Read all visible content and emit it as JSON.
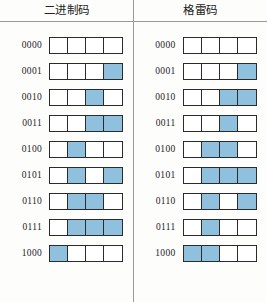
{
  "figure": {
    "title": "",
    "colors": {
      "bit_on": "#8fc1de",
      "bit_off": "#ffffff",
      "cell_border": "#2b2b2b",
      "rule": "#9a9a9a",
      "background": "#fdfdfc",
      "text": "#1c1c1c"
    }
  },
  "columns": [
    {
      "id": "binary",
      "header": "二进制码"
    },
    {
      "id": "gray",
      "header": "格雷码"
    }
  ],
  "chart_data": {
    "type": "table",
    "title": "",
    "subtitle": "",
    "xlabel": "",
    "ylabel": "",
    "grid": false,
    "legend": "none",
    "columns": [
      "二进制码",
      "格雷码"
    ],
    "bit_width": 4,
    "row_labels": [
      "0000",
      "0001",
      "0010",
      "0011",
      "0100",
      "0101",
      "0110",
      "0111",
      "1000"
    ],
    "series": [
      {
        "name": "二进制码",
        "codes": [
          "0000",
          "0001",
          "0010",
          "0011",
          "0100",
          "0101",
          "0110",
          "0111",
          "1000"
        ],
        "bits": [
          [
            0,
            0,
            0,
            0
          ],
          [
            0,
            0,
            0,
            1
          ],
          [
            0,
            0,
            1,
            0
          ],
          [
            0,
            0,
            1,
            1
          ],
          [
            0,
            1,
            0,
            0
          ],
          [
            0,
            1,
            0,
            1
          ],
          [
            0,
            1,
            1,
            0
          ],
          [
            0,
            1,
            1,
            1
          ],
          [
            1,
            0,
            0,
            0
          ]
        ]
      },
      {
        "name": "格雷码",
        "codes": [
          "0000",
          "0001",
          "0011",
          "0010",
          "0110",
          "0111",
          "0101",
          "0100",
          "1100"
        ],
        "bits": [
          [
            0,
            0,
            0,
            0
          ],
          [
            0,
            0,
            0,
            1
          ],
          [
            0,
            0,
            1,
            1
          ],
          [
            0,
            0,
            1,
            0
          ],
          [
            0,
            1,
            1,
            0
          ],
          [
            0,
            1,
            1,
            1
          ],
          [
            0,
            1,
            0,
            1
          ],
          [
            0,
            1,
            0,
            0
          ],
          [
            1,
            1,
            0,
            0
          ]
        ]
      }
    ]
  }
}
